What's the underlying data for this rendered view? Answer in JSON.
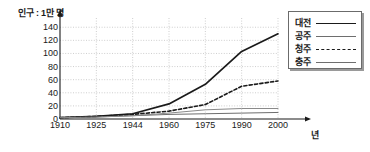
{
  "chart_data": {
    "type": "line",
    "title": "",
    "ylabel": "인구 : 1만 명",
    "xlabel": "년",
    "categories": [
      "1910",
      "1925",
      "1944",
      "1960",
      "1975",
      "1990",
      "2000"
    ],
    "yticks": [
      "0",
      "20",
      "40",
      "60",
      "80",
      "100",
      "120",
      "140"
    ],
    "ylim": [
      0,
      148
    ],
    "grid": true,
    "legend_position": "top-right",
    "series": [
      {
        "name": "대전",
        "style": "thick-solid",
        "color": "#1a1a1a",
        "values": [
          2,
          4,
          8,
          23,
          53,
          103,
          130
        ]
      },
      {
        "name": "공주",
        "style": "thin-solid",
        "color": "#6e6e6e",
        "values": [
          2,
          3,
          5,
          7,
          8,
          9,
          10
        ]
      },
      {
        "name": "청주",
        "style": "dashed",
        "color": "#1a1a1a",
        "values": [
          2,
          4,
          7,
          12,
          22,
          50,
          58
        ]
      },
      {
        "name": "충주",
        "style": "thin-solid",
        "color": "#8a8a8a",
        "values": [
          2,
          3,
          5,
          9,
          14,
          16,
          16
        ]
      }
    ]
  }
}
